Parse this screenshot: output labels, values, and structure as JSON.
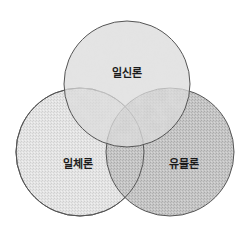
{
  "diagram": {
    "type": "venn",
    "sets": [
      {
        "id": "top",
        "label": "일신론",
        "cx": 127,
        "cy": 84,
        "r": 63,
        "fill": "#d6d6d6",
        "texture": "marble"
      },
      {
        "id": "left",
        "label": "일체론",
        "cx": 80,
        "cy": 152,
        "r": 64,
        "fill": "#e2e2e2",
        "texture": "crosshatch-light"
      },
      {
        "id": "right",
        "label": "유물론",
        "cx": 170,
        "cy": 152,
        "r": 64,
        "fill": "#c4c4c4",
        "texture": "crosshatch-dark"
      }
    ],
    "label_positions": {
      "top": {
        "x": 127,
        "y": 77
      },
      "left": {
        "x": 78,
        "y": 168
      },
      "right": {
        "x": 184,
        "y": 168
      }
    },
    "stroke_color": "#555555"
  }
}
